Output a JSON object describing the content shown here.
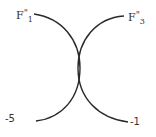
{
  "diagram": {
    "type": "curve-crossing",
    "labels": {
      "top_left": {
        "base": "F",
        "prime": "\"",
        "sub": "1"
      },
      "top_right": {
        "base": "F",
        "prime": "\"",
        "sub": "3"
      },
      "bottom_left": "-5",
      "bottom_right": "-1"
    },
    "curves": [
      {
        "name": "left-arc",
        "from": "F1''",
        "to": "-5",
        "bulge": "right",
        "color": "#2a2a2a"
      },
      {
        "name": "right-arc",
        "from": "F3''",
        "to": "-1",
        "bulge": "left",
        "color": "#2a2a2a"
      }
    ],
    "line_color": "#2a2a2a",
    "background": "#ffffff"
  }
}
